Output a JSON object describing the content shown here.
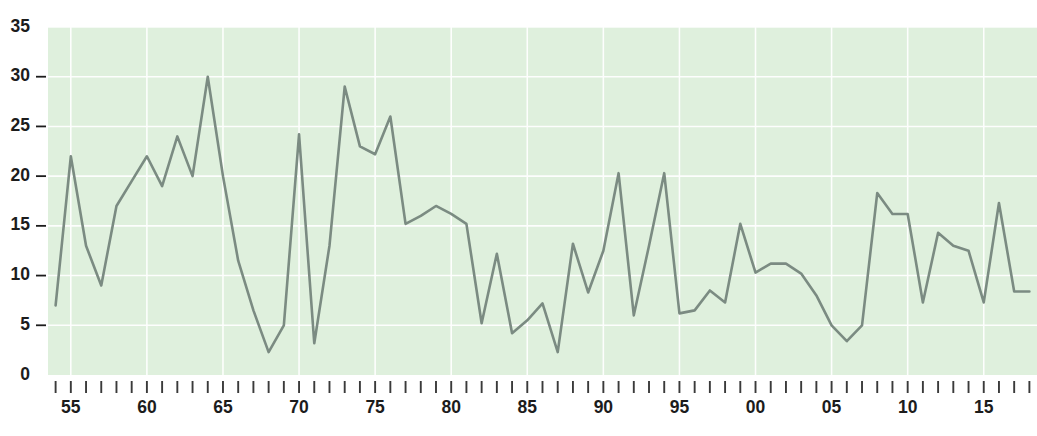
{
  "chart_data": {
    "type": "line",
    "title": "",
    "subtitle": "",
    "xlabel": "",
    "ylabel": "",
    "xlim": [
      1953.5,
      2018.5
    ],
    "ylim": [
      0,
      35
    ],
    "grid": true,
    "legend": null,
    "y_ticks": [
      0,
      5,
      10,
      15,
      20,
      25,
      30,
      35
    ],
    "y_tick_labels": [
      "0",
      "5",
      "10",
      "15",
      "20",
      "25",
      "30",
      "35"
    ],
    "x_tick_years": [
      1954,
      1955,
      1956,
      1957,
      1958,
      1959,
      1960,
      1961,
      1962,
      1963,
      1964,
      1965,
      1966,
      1967,
      1968,
      1969,
      1970,
      1971,
      1972,
      1973,
      1974,
      1975,
      1976,
      1977,
      1978,
      1979,
      1980,
      1981,
      1982,
      1983,
      1984,
      1985,
      1986,
      1987,
      1988,
      1989,
      1990,
      1991,
      1992,
      1993,
      1994,
      1995,
      1996,
      1997,
      1998,
      1999,
      2000,
      2001,
      2002,
      2003,
      2004,
      2005,
      2006,
      2007,
      2008,
      2009,
      2010,
      2011,
      2012,
      2013,
      2014,
      2015,
      2016,
      2017,
      2018
    ],
    "x_labeled_years": [
      1955,
      1960,
      1965,
      1970,
      1975,
      1980,
      1985,
      1990,
      1995,
      2000,
      2005,
      2010,
      2015
    ],
    "x_tick_labels": [
      "55",
      "60",
      "65",
      "70",
      "75",
      "80",
      "85",
      "90",
      "95",
      "00",
      "05",
      "10",
      "15"
    ],
    "series": [
      {
        "name": "series-1",
        "color": "#7b8b82",
        "x": [
          1954,
          1955,
          1956,
          1957,
          1958,
          1959,
          1960,
          1961,
          1962,
          1963,
          1964,
          1965,
          1966,
          1967,
          1968,
          1969,
          1970,
          1971,
          1972,
          1973,
          1974,
          1975,
          1976,
          1977,
          1978,
          1979,
          1980,
          1981,
          1982,
          1983,
          1984,
          1985,
          1986,
          1987,
          1988,
          1989,
          1990,
          1991,
          1992,
          1993,
          1994,
          1995,
          1996,
          1997,
          1998,
          1999,
          2000,
          2001,
          2002,
          2003,
          2004,
          2005,
          2006,
          2007,
          2008,
          2009,
          2010,
          2011,
          2012,
          2013,
          2014,
          2015,
          2016,
          2017,
          2018
        ],
        "values": [
          7.0,
          22.0,
          13.0,
          9.0,
          17.0,
          19.5,
          22.0,
          19.0,
          24.0,
          20.0,
          30.0,
          20.0,
          11.5,
          6.5,
          2.3,
          5.0,
          24.2,
          3.2,
          13.0,
          29.0,
          23.0,
          22.2,
          26.0,
          15.2,
          16.0,
          17.0,
          16.2,
          15.2,
          5.2,
          12.2,
          4.2,
          5.5,
          7.2,
          2.3,
          13.2,
          8.3,
          12.5,
          20.3,
          6.0,
          13.0,
          20.3,
          6.2,
          6.5,
          8.5,
          7.3,
          15.2,
          10.3,
          11.2,
          11.2,
          10.2,
          8.0,
          5.0,
          3.4,
          5.0,
          18.3,
          16.2,
          16.2,
          7.3,
          14.3,
          13.0,
          12.5,
          7.3,
          17.3,
          8.4,
          8.4
        ],
        "marker": "none",
        "line_width": 2.6
      }
    ],
    "plot_background": "#dff0dd",
    "page_background": "#ffffff",
    "gridline_color": "#ffffff",
    "axis_text_color": "#1c1c1c"
  },
  "axis": {
    "y_label_suffix": "",
    "x_label_suffix": ""
  }
}
